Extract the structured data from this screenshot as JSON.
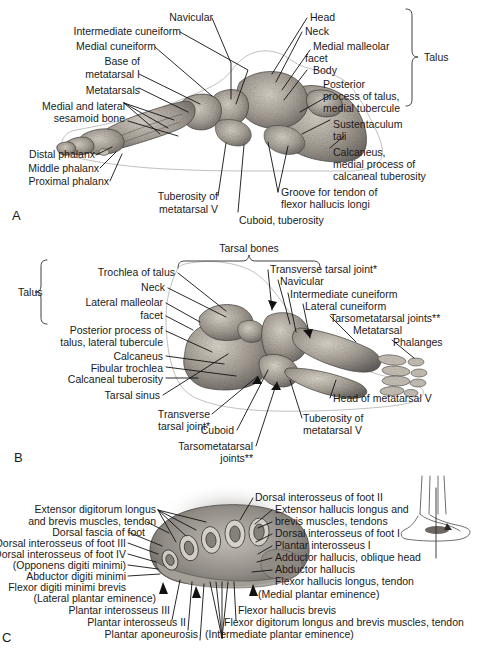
{
  "plate": {
    "title": "Bones and cross-section of the foot",
    "background_color": "#ffffff",
    "text_color": "#1a1a1a",
    "leader_color": "#111111",
    "outline_color": "#b9b9b9"
  },
  "panel_a": {
    "letter": "A",
    "view": "medial view of foot skeleton",
    "bracket_group": {
      "label": "Talus"
    },
    "labels": [
      {
        "id": "navicular",
        "text": "Navicular"
      },
      {
        "id": "intermediate-cuneiform",
        "text": "Intermediate cuneiform"
      },
      {
        "id": "medial-cuneiform",
        "text": "Medial cuneiform"
      },
      {
        "id": "base-of-metatarsal-i-1",
        "text": "Base of"
      },
      {
        "id": "base-of-metatarsal-i-2",
        "text": "metatarsal I"
      },
      {
        "id": "metatarsals",
        "text": "Metatarsals"
      },
      {
        "id": "sesamoid-1",
        "text": "Medial and lateral"
      },
      {
        "id": "sesamoid-2",
        "text": "sesamoid bone"
      },
      {
        "id": "distal-phalanx",
        "text": "Distal phalanx"
      },
      {
        "id": "middle-phalanx",
        "text": "Middle phalanx"
      },
      {
        "id": "proximal-phalanx",
        "text": "Proximal phalanx"
      },
      {
        "id": "tuberosity-mt5-1",
        "text": "Tuberosity of"
      },
      {
        "id": "tuberosity-mt5-2",
        "text": "metatarsal V"
      },
      {
        "id": "cuboid-tuberosity",
        "text": "Cuboid, tuberosity"
      },
      {
        "id": "head",
        "text": "Head"
      },
      {
        "id": "neck",
        "text": "Neck"
      },
      {
        "id": "medial-malleolar-facet-1",
        "text": "Medial malleolar"
      },
      {
        "id": "medial-malleolar-facet-2",
        "text": "facet"
      },
      {
        "id": "body",
        "text": "Body"
      },
      {
        "id": "posterior-process-1",
        "text": "Posterior"
      },
      {
        "id": "posterior-process-2",
        "text": "process of talus,"
      },
      {
        "id": "posterior-process-3",
        "text": "medial tubercule"
      },
      {
        "id": "sustentaculum-tali-1",
        "text": "Sustentaculum"
      },
      {
        "id": "sustentaculum-tali-2",
        "text": "tali"
      },
      {
        "id": "calcaneus-1",
        "text": "Calcaneus,"
      },
      {
        "id": "calcaneus-2",
        "text": "medial process of"
      },
      {
        "id": "calcaneus-3",
        "text": "calcaneal tuberosity"
      },
      {
        "id": "groove-fhl-1",
        "text": "Groove for tendon of"
      },
      {
        "id": "groove-fhl-2",
        "text": "flexor hallucis longi"
      }
    ]
  },
  "panel_b": {
    "letter": "B",
    "view": "lateral view of foot skeleton",
    "bracket_groups": [
      {
        "id": "talus-bracket",
        "label": "Talus"
      },
      {
        "id": "tarsal-bones-bracket",
        "label": "Tarsal bones"
      }
    ],
    "labels": [
      {
        "id": "trochlea-of-talus",
        "text": "Trochlea of talus"
      },
      {
        "id": "neck",
        "text": "Neck"
      },
      {
        "id": "lateral-malleolar-facet-1",
        "text": "Lateral malleolar"
      },
      {
        "id": "lateral-malleolar-facet-2",
        "text": "facet"
      },
      {
        "id": "posterior-process-1",
        "text": "Posterior process of"
      },
      {
        "id": "posterior-process-2",
        "text": "talus, lateral tubercule"
      },
      {
        "id": "calcaneus",
        "text": "Calcaneus"
      },
      {
        "id": "fibular-trochlea",
        "text": "Fibular trochlea"
      },
      {
        "id": "calcaneal-tuberosity",
        "text": "Calcaneal tuberosity"
      },
      {
        "id": "tarsal-sinus",
        "text": "Tarsal sinus"
      },
      {
        "id": "transverse-tarsal-joint-low-1",
        "text": "Transverse"
      },
      {
        "id": "transverse-tarsal-joint-low-2",
        "text": "tarsal joint*"
      },
      {
        "id": "cuboid",
        "text": "Cuboid"
      },
      {
        "id": "tarsometatarsal-joints-low-1",
        "text": "Tarsometatarsal"
      },
      {
        "id": "tarsometatarsal-joints-low-2",
        "text": "joints**"
      },
      {
        "id": "transverse-tarsal-joint-top",
        "text": "Transverse tarsal joint*"
      },
      {
        "id": "navicular",
        "text": "Navicular"
      },
      {
        "id": "intermediate-cuneiform",
        "text": "Intermediate cuneiform"
      },
      {
        "id": "lateral-cuneiform",
        "text": "Lateral cuneiform"
      },
      {
        "id": "tarsometatarsal-joints-right",
        "text": "Tarsometatarsal joints**"
      },
      {
        "id": "metatarsal",
        "text": "Metatarsal"
      },
      {
        "id": "phalanges",
        "text": "Phalanges"
      },
      {
        "id": "head-of-metatarsal-v",
        "text": "Head of metatarsal V"
      },
      {
        "id": "tuberosity-mt5-1",
        "text": "Tuberosity of"
      },
      {
        "id": "tuberosity-mt5-2",
        "text": "metatarsal V"
      }
    ]
  },
  "panel_c": {
    "letter": "C",
    "view": "transverse cross-section of the foot",
    "inset": {
      "id": "orientation-inset",
      "description": "small lateral foot line drawing with section plane line"
    },
    "labels_left": [
      {
        "id": "edl-eb-tendon-1",
        "text": "Extensor digitorum longus"
      },
      {
        "id": "edl-eb-tendon-2",
        "text": "and brevis muscles, tendon"
      },
      {
        "id": "dorsal-fascia-of-foot",
        "text": "Dorsal fascia of foot"
      },
      {
        "id": "dorsal-interosseus-iii",
        "text": "Dorsal interosseus of foot III"
      },
      {
        "id": "dorsal-interosseus-iv",
        "text": "Dorsal interosseus of foot IV"
      },
      {
        "id": "opponens-digiti-minimi",
        "text": "(Opponens digiti minimi)"
      },
      {
        "id": "abductor-digiti-minimi",
        "text": "Abductor digiti minimi"
      },
      {
        "id": "flexor-digiti-minimi-brevis",
        "text": "Flexor digiti minimi brevis"
      },
      {
        "id": "lateral-plantar-eminence",
        "text": "(Lateral plantar eminence)"
      }
    ],
    "labels_right": [
      {
        "id": "dorsal-interosseus-ii",
        "text": "Dorsal interosseus of foot II"
      },
      {
        "id": "ehl-eb-tendons-1",
        "text": "Extensor hallucis longus and"
      },
      {
        "id": "ehl-eb-tendons-2",
        "text": "brevis muscles, tendons"
      },
      {
        "id": "dorsal-interosseus-i",
        "text": "Dorsal interosseus of foot I"
      },
      {
        "id": "plantar-interosseus-i",
        "text": "Plantar interosseus I"
      },
      {
        "id": "adductor-hallucis-oblique-head",
        "text": "Adductor hallucis, oblique head"
      },
      {
        "id": "abductor-hallucis",
        "text": "Abductor hallucis"
      },
      {
        "id": "flexor-hallucis-longus-tendon",
        "text": "Flexor hallucis longus, tendon"
      },
      {
        "id": "medial-plantar-eminence",
        "text": "(Medial plantar eminence)"
      }
    ],
    "labels_bottom": [
      {
        "id": "plantar-interosseus-iii",
        "text": "Plantar interosseus III"
      },
      {
        "id": "plantar-interosseus-ii",
        "text": "Plantar interosseus II"
      },
      {
        "id": "plantar-aponeurosis",
        "text": "Plantar aponeurosis"
      },
      {
        "id": "flexor-hallucis-brevis",
        "text": "Flexor hallucis brevis"
      },
      {
        "id": "fdl-fb-tendon",
        "text": "Flexor digitorum longus and brevis muscles, tendon"
      },
      {
        "id": "intermediate-plantar-eminence",
        "text": "(Intermediate plantar eminence)"
      }
    ]
  }
}
